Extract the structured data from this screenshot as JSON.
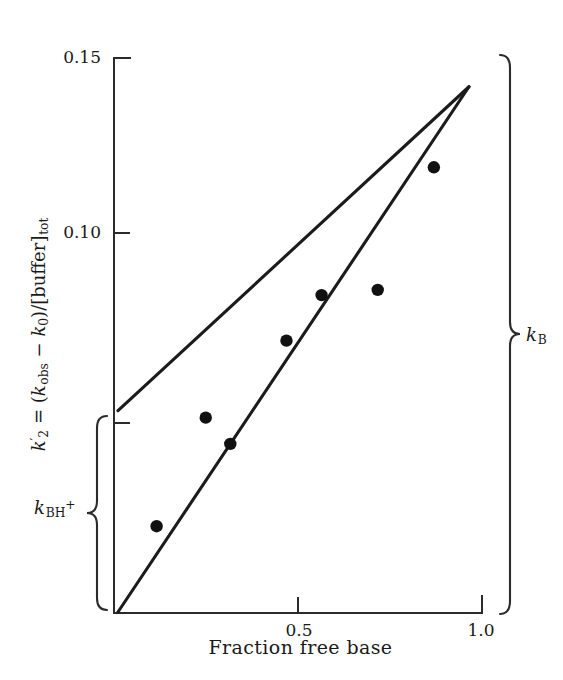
{
  "figure": {
    "background_color": "#ffffff",
    "ink_color": "#1a1a1a",
    "line_color": "#1b1b1b",
    "point_color": "#111111"
  },
  "axes": {
    "y_tick_labels": [
      "0.15",
      "0.10"
    ],
    "y_tick_values": [
      0.15,
      0.1
    ],
    "y_unticked_label": "",
    "x_tick_labels": [
      "0.5",
      "1.0"
    ],
    "x_tick_values": [
      0.5,
      1.0
    ],
    "x_title": "Fraction free base",
    "y_title_parts": {
      "k": "k",
      "prime": "′",
      "sub2": "2",
      "equals": " = (",
      "k2": "k",
      "subobs": "obs",
      "minus": " − ",
      "k3": "k",
      "sub0": "0",
      "close": ")/[buffer]",
      "subtot": "tot"
    },
    "y_title_plain": "k'2 = (kobs - k0)/[buffer]tot"
  },
  "annotations": {
    "right_bracket_label_parts": {
      "k": "k",
      "sub": "B"
    },
    "right_bracket_label_plain": "kB",
    "left_bracket_label_parts": {
      "k": "k",
      "sub": "BH",
      "sup": "+"
    },
    "left_bracket_label_plain": "kBH+"
  },
  "chart_data": {
    "type": "scatter",
    "title": "",
    "subtitle": "",
    "xlabel": "Fraction free base",
    "ylabel": "k'2 = (kobs - k0)/[buffer]tot",
    "xlim": [
      0.0,
      1.04
    ],
    "ylim": [
      0.0,
      0.1585
    ],
    "xticks": [
      0.5,
      1.0
    ],
    "xtick_labels": [
      "0.5",
      "1.0"
    ],
    "yticks": [
      0.1,
      0.15
    ],
    "ytick_labels": [
      "0.10",
      "0.15"
    ],
    "grid": false,
    "legend": false,
    "legend_position": "none",
    "series": [
      {
        "name": "observed second-order buffer rate constants",
        "type": "scatter",
        "marker": "filled-circle",
        "x": [
          0.11,
          0.25,
          0.32,
          0.48,
          0.58,
          0.74,
          0.9
        ],
        "y": [
          0.0245,
          0.0555,
          0.048,
          0.0775,
          0.0905,
          0.092,
          0.127
        ]
      },
      {
        "name": "lower limiting line (through origin)",
        "type": "line",
        "x": [
          0.0,
          1.0
        ],
        "y": [
          0.0,
          0.15
        ]
      },
      {
        "name": "upper limiting line (positive intercept)",
        "type": "line",
        "x": [
          0.0,
          1.0
        ],
        "y": [
          0.0575,
          0.15
        ]
      }
    ],
    "annotations": [
      {
        "text": "kB",
        "kind": "bracket",
        "side": "right",
        "y_from": 0.0,
        "y_to": 0.15
      },
      {
        "text": "kBH+",
        "kind": "bracket",
        "side": "left",
        "y_from": 0.0,
        "y_to": 0.0575
      }
    ]
  }
}
